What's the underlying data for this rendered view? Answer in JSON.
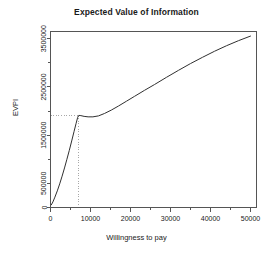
{
  "chart_data": {
    "type": "line",
    "title": "Expected Value of Information",
    "xlabel": "Willingness to pay",
    "ylabel": "EVPI",
    "xlim": [
      0,
      51500
    ],
    "ylim": [
      0,
      3650000
    ],
    "grid": false,
    "legend": null,
    "x_ticks": [
      0,
      10000,
      20000,
      30000,
      40000,
      50000
    ],
    "x_tick_labels": [
      "0",
      "10000",
      "20000",
      "30000",
      "40000",
      "50000"
    ],
    "x_minor_ticks": [
      5000,
      15000,
      25000,
      35000,
      45000
    ],
    "y_ticks": [
      0,
      500000,
      1500000,
      2500000,
      3500000
    ],
    "y_tick_labels": [
      "0",
      "500000",
      "1500000",
      "2500000",
      "3500000"
    ],
    "y_minor_ticks": [
      1000000,
      2000000,
      3000000
    ],
    "series": [
      {
        "name": "EVPI",
        "x": [
          200,
          600,
          1100,
          1700,
          2300,
          2900,
          3500,
          4100,
          4700,
          5300,
          5900,
          6400,
          6800,
          7000,
          7100,
          7600,
          8400,
          9400,
          10600,
          12000,
          13500,
          15200,
          17000,
          19000,
          21000,
          23500,
          26000,
          29000,
          32000,
          35000,
          38000,
          41000,
          44000,
          47000,
          50000
        ],
        "y": [
          55000,
          115000,
          215000,
          345000,
          490000,
          650000,
          820000,
          1000000,
          1185000,
          1380000,
          1580000,
          1745000,
          1870000,
          1905000,
          1910000,
          1905000,
          1890000,
          1880000,
          1880000,
          1900000,
          1950000,
          2020000,
          2105000,
          2205000,
          2305000,
          2430000,
          2550000,
          2700000,
          2845000,
          2985000,
          3115000,
          3240000,
          3355000,
          3460000,
          3555000
        ]
      }
    ],
    "annotations": {
      "reference_lines": {
        "vertical_x": 7000,
        "horizontal_y": 1905000,
        "style": "dotted",
        "color": "#999999"
      },
      "kink_point": {
        "x": 7000,
        "y": 1905000
      }
    },
    "colors": {
      "curve": "#303030",
      "axis": "#555555",
      "reference": "#a8a8a8",
      "text": "#1a1a1a",
      "background": "#ffffff"
    }
  }
}
